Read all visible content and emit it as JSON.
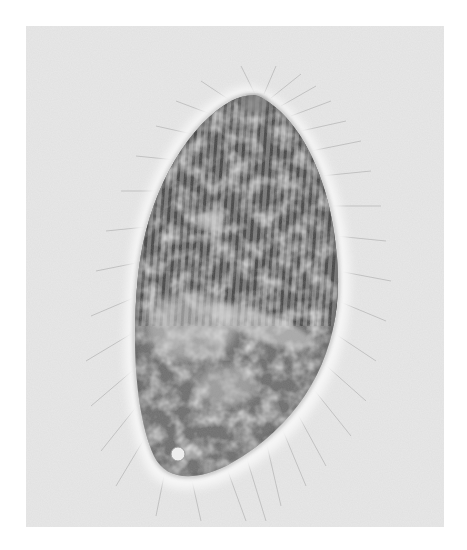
{
  "image": {
    "description": "Phase-contrast micrograph of a ciliate protozoan with an ovoid, striated body surrounded by fine radiating cilia",
    "background_color": "#ffffff",
    "photo_background": "#e9e9e9",
    "body_color": "#6e6e6e",
    "halo_color": "#f4f4f4"
  }
}
